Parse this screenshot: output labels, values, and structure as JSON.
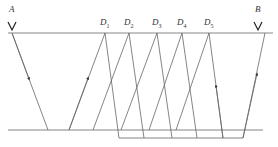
{
  "labels": {
    "A": "A",
    "B": "B",
    "D": [
      {
        "main": "D",
        "sub": "1"
      },
      {
        "main": "D",
        "sub": "2"
      },
      {
        "main": "D",
        "sub": "3"
      },
      {
        "main": "D",
        "sub": "4"
      },
      {
        "main": "D",
        "sub": "5"
      }
    ]
  },
  "colors": {
    "line": "#555555",
    "text": "#333333"
  }
}
